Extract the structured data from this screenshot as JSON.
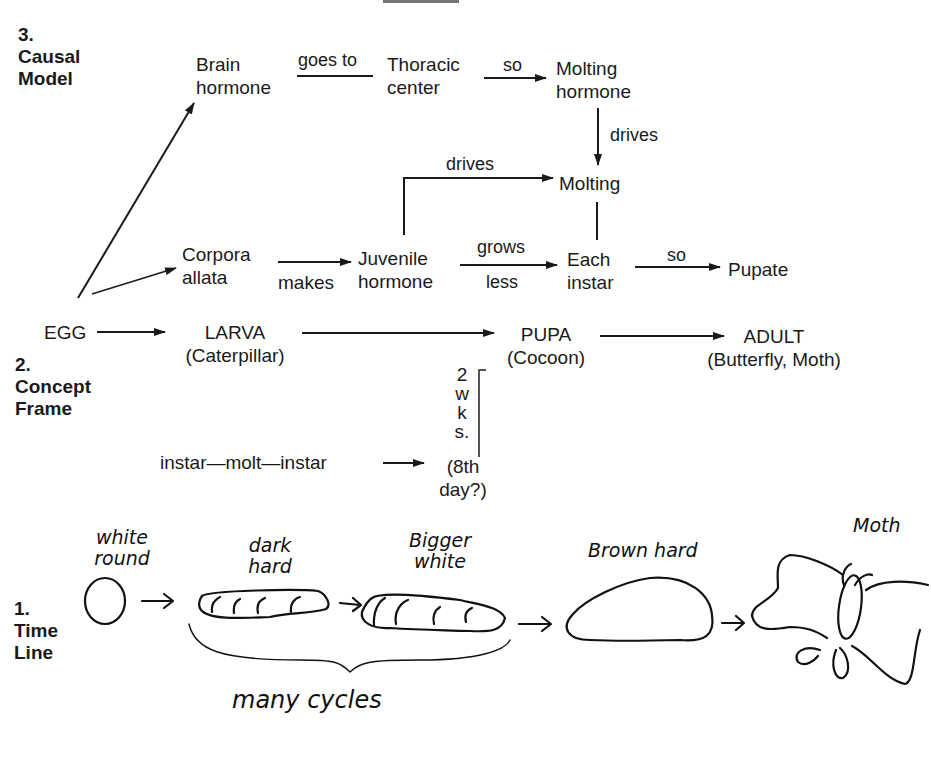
{
  "sections": {
    "causal_model": {
      "number": "3.",
      "title_line1": "Causal",
      "title_line2": "Model"
    },
    "concept_frame": {
      "number": "2.",
      "title_line1": "Concept",
      "title_line2": "Frame"
    },
    "time_line": {
      "number": "1.",
      "title_line1": "Time",
      "title_line2": "Line"
    }
  },
  "causal": {
    "brain_hormone": [
      "Brain",
      "hormone"
    ],
    "goes_to": "goes to",
    "thoracic_center": [
      "Thoracic",
      "center"
    ],
    "so1": "so",
    "molting_hormone": [
      "Molting",
      "hormone"
    ],
    "drives1": "drives",
    "drives2": "drives",
    "molting": "Molting",
    "corpora_allata": [
      "Corpora",
      "allata"
    ],
    "makes": "makes",
    "juvenile_hormone": [
      "Juvenile",
      "hormone"
    ],
    "grows": "grows",
    "less": "less",
    "each_instar": [
      "Each",
      "instar"
    ],
    "so2": "so",
    "pupate": "Pupate"
  },
  "concept": {
    "egg": "EGG",
    "larva": "LARVA",
    "larva_sub": "(Caterpillar)",
    "pupa": "PUPA",
    "pupa_sub": "(Cocoon)",
    "adult": "ADULT",
    "adult_sub": "(Butterfly, Moth)",
    "instar_seq": "instar—molt—instar",
    "duration": [
      "2",
      "w",
      "k",
      "s."
    ],
    "eighth_day": [
      "(8th",
      "day?)"
    ]
  },
  "timeline": {
    "egg_label": [
      "white",
      "round"
    ],
    "larva1_label": [
      "dark",
      "hard"
    ],
    "larva2_label": [
      "Bigger",
      "white"
    ],
    "pupa_label": "Brown hard",
    "adult_label": "Moth",
    "brace_label": "many cycles"
  }
}
